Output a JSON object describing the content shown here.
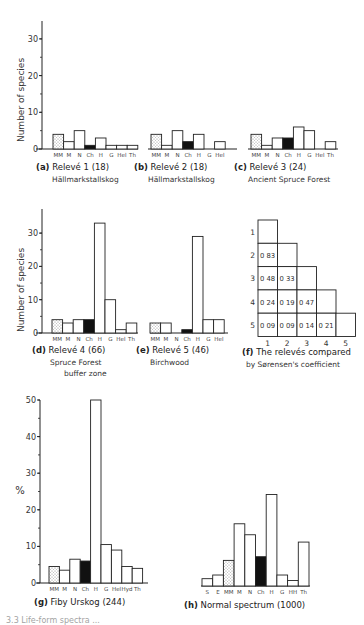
{
  "figure": {
    "ylabel_count": "Number of species",
    "ylabel_percent": "%",
    "legend_patterns": {
      "MM": "dotted",
      "Ch": "solid-black",
      "default": "white"
    },
    "colors": {
      "ink": "#222222",
      "fill_white": "#ffffff",
      "fill_black": "#111111",
      "dot": "#888888"
    },
    "bottom_caption_partial": "3.3  Life-form spectra ..."
  },
  "captions": {
    "a": {
      "letter": "(a)",
      "title": "Relevé 1 (18)",
      "sub": "Hällmarkstallskog"
    },
    "b": {
      "letter": "(b)",
      "title": "Relevé 2 (18)",
      "sub": "Hällmarkstallskog"
    },
    "c": {
      "letter": "(c)",
      "title": "Relevé 3 (24)",
      "sub": "Ancient Spruce Forest"
    },
    "d": {
      "letter": "(d)",
      "title": "Relevé 4 (66)",
      "sub": "Spruce Forest",
      "sub2": "buffer zone"
    },
    "e": {
      "letter": "(e)",
      "title": "Relevé 5 (46)",
      "sub": "Birchwood"
    },
    "f": {
      "letter": "(f)",
      "title": "The relevés compared",
      "sub": "by Sørensen's coefficient"
    },
    "g": {
      "letter": "(g)",
      "title": "Fiby Urskog (244)"
    },
    "h": {
      "letter": "(h)",
      "title": "Normal spectrum (1000)"
    }
  },
  "chart_data": [
    {
      "id": "a",
      "type": "bar",
      "title": "Relevé 1 (18) Hällmarkstallskog",
      "ylabel": "Number of species",
      "ylim": [
        0,
        35
      ],
      "yticks": [
        0,
        10,
        20,
        30
      ],
      "categories": [
        "MM",
        "M",
        "N",
        "Ch",
        "H",
        "G",
        "Hel",
        "Th"
      ],
      "values": [
        4,
        2,
        5,
        1,
        3,
        1,
        1,
        1
      ]
    },
    {
      "id": "b",
      "type": "bar",
      "title": "Relevé 2 (18) Hällmarkstallskog",
      "ylabel": "Number of species",
      "ylim": [
        0,
        35
      ],
      "categories": [
        "MM",
        "M",
        "N",
        "Ch",
        "H",
        "G",
        "Hel"
      ],
      "values": [
        4,
        1,
        5,
        2,
        4,
        0,
        2
      ]
    },
    {
      "id": "c",
      "type": "bar",
      "title": "Relevé 3 (24) Ancient Spruce Forest",
      "ylabel": "Number of species",
      "ylim": [
        0,
        35
      ],
      "categories": [
        "MM",
        "M",
        "N",
        "Ch",
        "H",
        "G",
        "Hel",
        "Th"
      ],
      "values": [
        4,
        1,
        3,
        3,
        6,
        5,
        0,
        2
      ]
    },
    {
      "id": "d",
      "type": "bar",
      "title": "Relevé 4 (66) Spruce Forest buffer zone",
      "ylabel": "Number of species",
      "ylim": [
        0,
        35
      ],
      "yticks": [
        0,
        10,
        20,
        30
      ],
      "categories": [
        "MM",
        "M",
        "N",
        "Ch",
        "H",
        "G",
        "Hel",
        "Th"
      ],
      "values": [
        4,
        3,
        4,
        4,
        33,
        10,
        1,
        3
      ]
    },
    {
      "id": "e",
      "type": "bar",
      "title": "Relevé 5 (46) Birchwood",
      "ylabel": "Number of species",
      "ylim": [
        0,
        35
      ],
      "categories": [
        "MM",
        "M",
        "N",
        "Ch",
        "H",
        "G",
        "Hel"
      ],
      "values": [
        3,
        3,
        0,
        1,
        29,
        4,
        4
      ]
    },
    {
      "id": "f",
      "type": "table",
      "title": "The relevés compared by Sørensen's coefficient",
      "row_labels": [
        "1",
        "2",
        "3",
        "4",
        "5"
      ],
      "col_labels": [
        "1",
        "2",
        "3",
        "4",
        "5"
      ],
      "cells": [
        [
          ""
        ],
        [
          "0.83",
          ""
        ],
        [
          "0.48",
          "0.33",
          ""
        ],
        [
          "0.24",
          "0.19",
          "0.47",
          ""
        ],
        [
          "0.09",
          "0.09",
          "0.14",
          "0.21",
          ""
        ]
      ]
    },
    {
      "id": "g",
      "type": "bar",
      "title": "Fiby Urskog (244)",
      "ylabel": "%",
      "ylim": [
        0,
        50
      ],
      "yticks": [
        0,
        10,
        20,
        30,
        40,
        50
      ],
      "categories": [
        "MM",
        "M",
        "N",
        "Ch",
        "H",
        "G",
        "Hel",
        "Hyd",
        "Th"
      ],
      "values": [
        4.5,
        3.5,
        6.5,
        6,
        50,
        10.5,
        9,
        4.5,
        4
      ]
    },
    {
      "id": "h",
      "type": "bar",
      "title": "Normal spectrum (1000)",
      "ylabel": "%",
      "ylim": [
        0,
        50
      ],
      "categories": [
        "S",
        "E",
        "MM",
        "M",
        "N",
        "Ch",
        "H",
        "G",
        "HH",
        "Th"
      ],
      "values": [
        2,
        3,
        7,
        17,
        14,
        8,
        25,
        3,
        1.5,
        12
      ]
    }
  ]
}
